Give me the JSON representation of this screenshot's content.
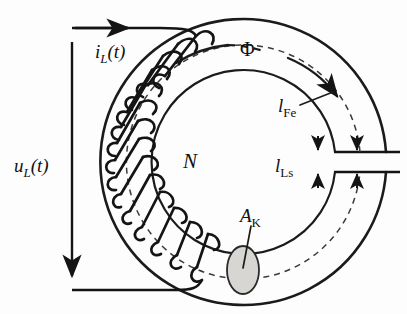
{
  "figure": {
    "background_color": "#fdfdfd",
    "line_color": "#1b1b1b",
    "core_fill_color": "#ffffff",
    "cross_section_fill": "#d8d6d2"
  },
  "labels": {
    "current": {
      "base": "i",
      "subscript": "L",
      "argument": "(t)",
      "full": "i_L(t)"
    },
    "voltage": {
      "base": "u",
      "subscript": "L",
      "argument": "(t)",
      "full": "u_L(t)"
    },
    "flux": {
      "symbol": "Φ",
      "full": "Φ"
    },
    "turns": {
      "symbol": "N",
      "full": "N"
    },
    "iron_path": {
      "base": "l",
      "subscript": "Fe",
      "full": "l_Fe"
    },
    "air_gap": {
      "base": "l",
      "subscript": "Ls",
      "full": "l_Ls"
    },
    "cross_section": {
      "base": "A",
      "subscript": "K",
      "full": "A_K"
    }
  },
  "geometry": {
    "toroid_center_x": 243,
    "toroid_center_y": 160,
    "outer_radius": 143,
    "inner_radius": 92,
    "mean_radius": 117,
    "winding_turns": 13,
    "gap_top_y": 152,
    "gap_bottom_y": 172,
    "cross_section_cx": 243,
    "cross_section_cy": 270,
    "cross_section_rx": 16,
    "cross_section_ry": 24
  }
}
